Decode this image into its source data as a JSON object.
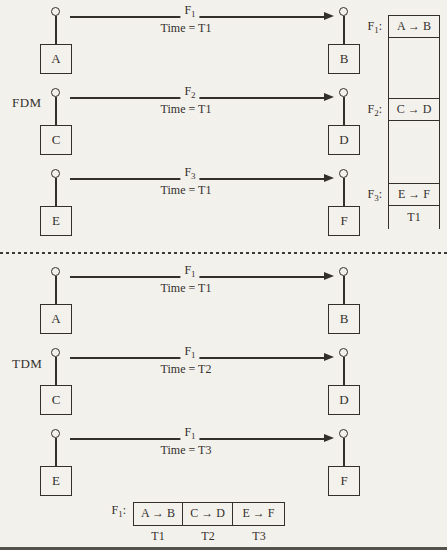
{
  "colors": {
    "paper": "#f3f1ec",
    "ink": "#33302c"
  },
  "fdm": {
    "section_label": "FDM",
    "links": [
      {
        "tx": "A",
        "rx": "B",
        "freq_base": "F",
        "freq_sub": "1",
        "time": "Time = T1"
      },
      {
        "tx": "C",
        "rx": "D",
        "freq_base": "F",
        "freq_sub": "2",
        "time": "Time = T1"
      },
      {
        "tx": "E",
        "rx": "F",
        "freq_base": "F",
        "freq_sub": "3",
        "time": "Time = T1"
      }
    ],
    "spectrum": {
      "bands": [
        {
          "label_base": "F",
          "label_sub": "1",
          "label_colon": ":",
          "content": "A → B"
        },
        {
          "label_base": "F",
          "label_sub": "2",
          "label_colon": ":",
          "content": "C → D"
        },
        {
          "label_base": "F",
          "label_sub": "3",
          "label_colon": ":",
          "content": "E → F"
        }
      ],
      "time_label": "T1"
    }
  },
  "tdm": {
    "section_label": "TDM",
    "links": [
      {
        "tx": "A",
        "rx": "B",
        "freq_base": "F",
        "freq_sub": "1",
        "time": "Time = T1"
      },
      {
        "tx": "C",
        "rx": "D",
        "freq_base": "F",
        "freq_sub": "1",
        "time": "Time = T2"
      },
      {
        "tx": "E",
        "rx": "F",
        "freq_base": "F",
        "freq_sub": "1",
        "time": "Time = T3"
      }
    ],
    "frame": {
      "label_base": "F",
      "label_sub": "1",
      "label_colon": ":",
      "slots": [
        {
          "content": "A → B",
          "time": "T1"
        },
        {
          "content": "C → D",
          "time": "T2"
        },
        {
          "content": "E → F",
          "time": "T3"
        }
      ]
    }
  }
}
